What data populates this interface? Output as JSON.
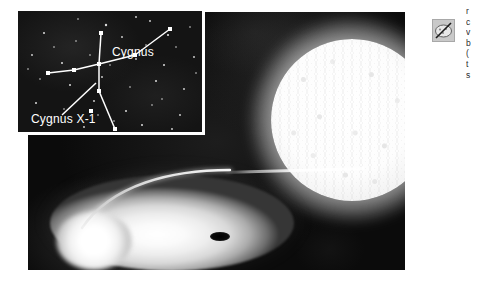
{
  "figure": {
    "background_color": "#070707",
    "panel_color": "#ffffff"
  },
  "inset": {
    "name": "constellation-chart",
    "background_color": "#141414",
    "border_color": "#ffffff",
    "labels": {
      "constellation": "Cygnus",
      "source": "Cygnus X-1"
    },
    "stars": [
      {
        "x": 88,
        "y": 14,
        "r": 1.2
      },
      {
        "x": 132,
        "y": 10,
        "r": 0.9
      },
      {
        "x": 26,
        "y": 22,
        "r": 1.0
      },
      {
        "x": 58,
        "y": 30,
        "r": 0.8
      },
      {
        "x": 104,
        "y": 26,
        "r": 0.9
      },
      {
        "x": 150,
        "y": 24,
        "r": 1.1
      },
      {
        "x": 172,
        "y": 16,
        "r": 0.8
      },
      {
        "x": 14,
        "y": 44,
        "r": 0.9
      },
      {
        "x": 44,
        "y": 52,
        "r": 1.0
      },
      {
        "x": 72,
        "y": 44,
        "r": 0.8
      },
      {
        "x": 118,
        "y": 48,
        "r": 0.9
      },
      {
        "x": 146,
        "y": 54,
        "r": 1.0
      },
      {
        "x": 176,
        "y": 46,
        "r": 0.9
      },
      {
        "x": 22,
        "y": 68,
        "r": 0.8
      },
      {
        "x": 52,
        "y": 74,
        "r": 1.0
      },
      {
        "x": 84,
        "y": 66,
        "r": 0.9
      },
      {
        "x": 112,
        "y": 76,
        "r": 0.8
      },
      {
        "x": 138,
        "y": 70,
        "r": 1.0
      },
      {
        "x": 166,
        "y": 78,
        "r": 0.9
      },
      {
        "x": 18,
        "y": 92,
        "r": 1.0
      },
      {
        "x": 46,
        "y": 98,
        "r": 0.8
      },
      {
        "x": 76,
        "y": 90,
        "r": 0.9
      },
      {
        "x": 108,
        "y": 100,
        "r": 1.0
      },
      {
        "x": 134,
        "y": 94,
        "r": 0.8
      },
      {
        "x": 162,
        "y": 104,
        "r": 0.9
      },
      {
        "x": 34,
        "y": 112,
        "r": 0.8
      },
      {
        "x": 66,
        "y": 116,
        "r": 0.9
      },
      {
        "x": 96,
        "y": 110,
        "r": 0.8
      },
      {
        "x": 124,
        "y": 114,
        "r": 1.0
      },
      {
        "x": 154,
        "y": 118,
        "r": 0.9
      },
      {
        "x": 178,
        "y": 62,
        "r": 0.8
      },
      {
        "x": 10,
        "y": 58,
        "r": 0.8
      },
      {
        "x": 60,
        "y": 8,
        "r": 0.8
      },
      {
        "x": 118,
        "y": 6,
        "r": 0.9
      },
      {
        "x": 36,
        "y": 36,
        "r": 0.8
      },
      {
        "x": 92,
        "y": 54,
        "r": 0.8
      },
      {
        "x": 158,
        "y": 36,
        "r": 0.8
      },
      {
        "x": 128,
        "y": 34,
        "r": 0.8
      },
      {
        "x": 80,
        "y": 104,
        "r": 0.8
      },
      {
        "x": 144,
        "y": 88,
        "r": 0.8
      }
    ],
    "constellation_nodes": [
      {
        "name": "deneb",
        "x": 83,
        "y": 22
      },
      {
        "name": "sadr",
        "x": 81,
        "y": 53
      },
      {
        "name": "gienah",
        "x": 117,
        "y": 44
      },
      {
        "name": "wing-tip",
        "x": 152,
        "y": 18
      },
      {
        "name": "delta-cygni",
        "x": 30,
        "y": 62
      },
      {
        "name": "mid-wing-left",
        "x": 56,
        "y": 59
      },
      {
        "name": "eta-cygni",
        "x": 81,
        "y": 80
      },
      {
        "name": "albireo",
        "x": 97,
        "y": 118
      },
      {
        "name": "cygnus-x1",
        "x": 73,
        "y": 100
      }
    ],
    "constellation_lines": [
      [
        "deneb",
        "sadr"
      ],
      [
        "sadr",
        "gienah"
      ],
      [
        "gienah",
        "wing-tip"
      ],
      [
        "sadr",
        "mid-wing-left"
      ],
      [
        "mid-wing-left",
        "delta-cygni"
      ],
      [
        "sadr",
        "eta-cygni"
      ],
      [
        "eta-cygni",
        "albireo"
      ]
    ],
    "pointer_line": {
      "from": {
        "x": 44,
        "y": 104
      },
      "to": {
        "x": 78,
        "y": 72
      }
    }
  },
  "scene": {
    "companion_star": {
      "name": "companion-star",
      "description": "bright mottled supergiant",
      "center": {
        "x": 324,
        "y": 108
      },
      "radius": 81,
      "color": "#ffffff"
    },
    "accretion_disk": {
      "name": "accretion-disk",
      "description": "elliptical glowing disk of infalling gas",
      "center": {
        "x": 144,
        "y": 211
      },
      "width": 244,
      "height": 96,
      "color": "#ffffff"
    },
    "black_hole": {
      "name": "black-hole",
      "description": "dark compact object at disk center",
      "center": {
        "x": 192,
        "y": 224
      },
      "width": 20,
      "height": 9,
      "color": "#000000"
    },
    "gas_stream": {
      "name": "gas-stream",
      "description": "thin accretion stream from star to disk",
      "color": "#ffffff"
    }
  },
  "corner_icon": {
    "name": "crossed-out-image-icon",
    "background_color": "#c9c9c9"
  },
  "caption": {
    "clipped": true,
    "lines": [
      "r",
      "c",
      "v",
      "b",
      "(",
      "t",
      "s"
    ]
  }
}
